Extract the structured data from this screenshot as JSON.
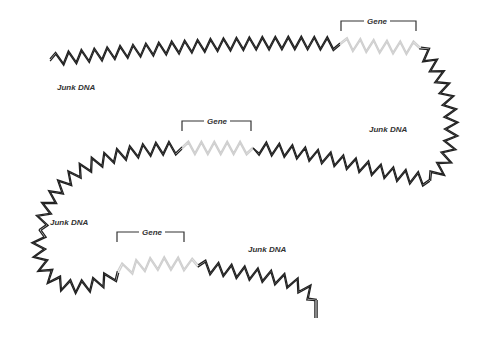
{
  "diagram": {
    "colors": {
      "junk": "#222222",
      "gene": "#cfcfcf",
      "bracket": "#333333"
    },
    "labels": {
      "junk": [
        {
          "text": "Junk DNA",
          "x": 57,
          "y": 88
        },
        {
          "text": "Junk DNA",
          "x": 369,
          "y": 130
        },
        {
          "text": "Junk DNA",
          "x": 50,
          "y": 223
        },
        {
          "text": "Junk DNA",
          "x": 248,
          "y": 250
        }
      ],
      "genes": [
        {
          "text": "Gene",
          "x": 377,
          "y": 26,
          "bx1": 341,
          "bx2": 416,
          "by": 21,
          "drop": 10
        },
        {
          "text": "Gene",
          "x": 217,
          "y": 126,
          "bx1": 182,
          "bx2": 251,
          "by": 121,
          "drop": 10
        },
        {
          "text": "Gene",
          "x": 152,
          "y": 233,
          "bx1": 117,
          "bx2": 184,
          "by": 232,
          "drop": 10
        }
      ]
    },
    "segments": [
      {
        "type": "junk",
        "points": [
          [
            50,
            60
          ],
          [
            150,
            48
          ],
          [
            250,
            40
          ],
          [
            340,
            44
          ]
        ]
      },
      {
        "type": "gene",
        "points": [
          [
            340,
            44
          ],
          [
            370,
            46
          ],
          [
            398,
            48
          ],
          [
            420,
            48
          ]
        ]
      },
      {
        "type": "junk",
        "points": [
          [
            420,
            48
          ],
          [
            460,
            90
          ],
          [
            460,
            160
          ],
          [
            430,
            180
          ]
        ]
      },
      {
        "type": "junk",
        "points": [
          [
            430,
            180
          ],
          [
            380,
            175
          ],
          [
            320,
            150
          ],
          [
            253,
            148
          ]
        ]
      },
      {
        "type": "gene",
        "points": [
          [
            253,
            148
          ],
          [
            230,
            148
          ],
          [
            205,
            148
          ],
          [
            182,
            148
          ]
        ]
      },
      {
        "type": "junk",
        "points": [
          [
            182,
            148
          ],
          [
            110,
            148
          ],
          [
            50,
            170
          ],
          [
            40,
            230
          ]
        ]
      },
      {
        "type": "junk",
        "points": [
          [
            40,
            230
          ],
          [
            30,
            290
          ],
          [
            80,
            300
          ],
          [
            118,
            272
          ]
        ]
      },
      {
        "type": "gene",
        "points": [
          [
            118,
            272
          ],
          [
            140,
            262
          ],
          [
            175,
            262
          ],
          [
            198,
            266
          ]
        ]
      },
      {
        "type": "junk",
        "points": [
          [
            198,
            266
          ],
          [
            250,
            275
          ],
          [
            300,
            275
          ],
          [
            316,
            300
          ]
        ]
      }
    ],
    "tail": [
      [
        316,
        300
      ],
      [
        316,
        318
      ]
    ]
  }
}
